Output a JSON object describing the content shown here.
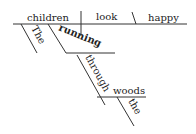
{
  "diagram": {
    "type": "sentence-diagram",
    "subject": "children",
    "verb": "look",
    "complement": "happy",
    "subject_modifier": "The",
    "participle": "running",
    "preposition": "through",
    "object_of_preposition": "woods",
    "object_modifier": "the"
  }
}
